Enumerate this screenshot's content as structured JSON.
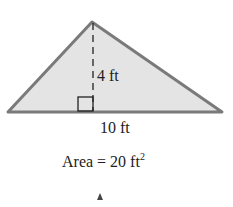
{
  "figure": {
    "shape": "triangle",
    "height_label": "4 ft",
    "base_label": "10 ft",
    "area_prefix": "Area = 20 ft",
    "area_exponent": "2",
    "fill_color": "#e6e6e6",
    "stroke_color": "#7a7a7a"
  },
  "bottom_glyph": "A"
}
